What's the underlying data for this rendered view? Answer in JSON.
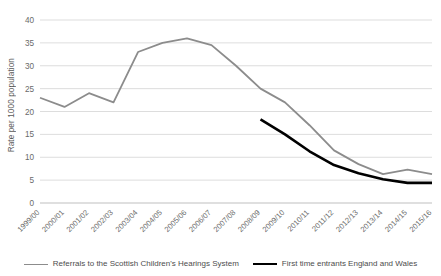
{
  "chart_data": {
    "type": "line",
    "title": "",
    "xlabel": "",
    "ylabel": "Rate per 1000 population",
    "ylim": [
      0,
      40
    ],
    "ytick_step": 5,
    "yticks": [
      0,
      5,
      10,
      15,
      20,
      25,
      30,
      35,
      40
    ],
    "grid": true,
    "legend_position": "bottom",
    "categories": [
      "1999/00",
      "2000/01",
      "2001/02",
      "2002/03",
      "2003/04",
      "2004/05",
      "2005/06",
      "2006/07",
      "2007/08",
      "2008/09",
      "2009/10",
      "2010/11",
      "2011/12",
      "2012/13",
      "2013/14",
      "2014/15",
      "2015/16"
    ],
    "series": [
      {
        "name": "Referrals to the Scottish Children's Hearings System",
        "color": "#8c8c8c",
        "line_width": 1.8,
        "values": [
          23,
          21,
          24,
          22,
          33,
          35,
          36,
          34.5,
          30,
          25,
          22,
          17,
          11.5,
          8.5,
          6.3,
          7.3,
          6.3
        ]
      },
      {
        "name": "First time entrants England and Wales",
        "color": "#000000",
        "line_width": 2.6,
        "values": [
          null,
          null,
          null,
          null,
          null,
          null,
          null,
          null,
          null,
          18.3,
          15,
          11.3,
          8.3,
          6.5,
          5.2,
          4.4,
          4.4
        ]
      }
    ]
  },
  "legend": {
    "items": [
      {
        "label": "Referrals to the Scottish Children's Hearings System",
        "color": "#8c8c8c",
        "weight": "thin"
      },
      {
        "label": "First time entrants England and Wales",
        "color": "#000000",
        "weight": "thick"
      }
    ]
  },
  "colors": {
    "grid": "#d4d4d4",
    "axis": "#bfbfbf",
    "text": "#6a6a6a",
    "series_gray": "#8c8c8c",
    "series_black": "#000000",
    "background": "#ffffff"
  }
}
